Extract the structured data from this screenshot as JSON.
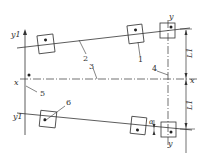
{
  "diagram": {
    "type": "technical-schematic",
    "axes": {
      "y1_top": "y1",
      "y1_bottom": "y1",
      "x_left": "x",
      "x_right": "x",
      "y_top": "y",
      "y_bottom": "y"
    },
    "callouts": [
      "1",
      "2",
      "3",
      "4",
      "5",
      "6"
    ],
    "dimensions": {
      "L1_upper": "L1",
      "L1_lower": "L1",
      "alpha": "α"
    },
    "colors": {
      "line": "#333333",
      "background": "#ffffff"
    }
  }
}
